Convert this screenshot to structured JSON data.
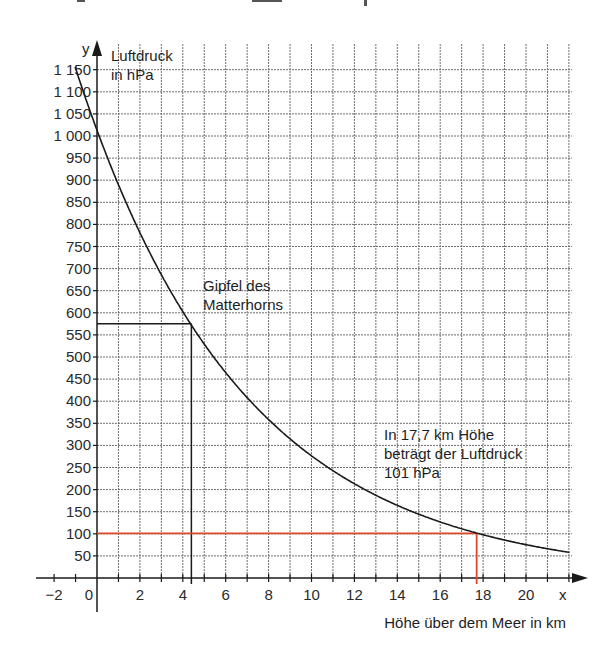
{
  "chart_data": {
    "type": "line",
    "title": "",
    "xlabel": "Höhe über dem Meer in km",
    "ylabel": "Luftdruck in hPa",
    "x_axis_symbol": "x",
    "y_axis_symbol": "y",
    "xlim": [
      -2.8,
      22
    ],
    "ylim": [
      0,
      1200
    ],
    "x_ticks": [
      -2,
      0,
      2,
      4,
      6,
      8,
      10,
      12,
      14,
      16,
      18,
      20
    ],
    "x_tick_labels": [
      "−2",
      "0",
      "2",
      "4",
      "6",
      "8",
      "10",
      "12",
      "14",
      "16",
      "18",
      "20"
    ],
    "y_ticks": [
      50,
      100,
      150,
      200,
      250,
      300,
      350,
      400,
      450,
      500,
      550,
      600,
      650,
      700,
      750,
      800,
      850,
      900,
      950,
      1000,
      1050,
      1100,
      1150
    ],
    "y_tick_labels": [
      "50",
      "100",
      "150",
      "200",
      "250",
      "300",
      "350",
      "400",
      "450",
      "500",
      "550",
      "600",
      "650",
      "700",
      "750",
      "800",
      "850",
      "900",
      "950",
      "1 000",
      "1 050",
      "1 100",
      "1 150"
    ],
    "grid": true,
    "series": [
      {
        "name": "Luftdruck",
        "color": "#1a1a1a",
        "x": [
          -1.0,
          0,
          1,
          2,
          3,
          4,
          4.4,
          5,
          6,
          7,
          8,
          9,
          10,
          11,
          12,
          13,
          14,
          15,
          16,
          17,
          17.7,
          18,
          19,
          20,
          21,
          22
        ],
        "y": [
          1150,
          1013,
          890,
          783,
          688,
          604,
          575,
          531,
          467,
          410,
          361,
          317,
          278,
          245,
          215,
          189,
          166,
          146,
          128,
          113,
          101,
          98,
          86,
          76,
          67,
          58
        ]
      }
    ],
    "markers": [
      {
        "name": "Matterhorn",
        "x": 4.4,
        "y": 575,
        "color": "#1a1a1a"
      },
      {
        "name": "17,7 km",
        "x": 17.7,
        "y": 101,
        "color": "#e0472a"
      }
    ],
    "annotations": [
      {
        "id": "matterhorn",
        "lines": [
          "Gipfel des",
          "Matterhorns"
        ]
      },
      {
        "id": "luftdruck_note",
        "lines": [
          "In 17,7 km Höhe",
          "beträgt der Luftdruck",
          "101 hPa"
        ]
      },
      {
        "id": "y_unit",
        "lines": [
          "Luftdruck",
          "in hPa"
        ]
      }
    ]
  },
  "colors": {
    "grid": "#6e6e6e",
    "axis": "#1a1a1a",
    "curve": "#1a1a1a",
    "highlight": "#e0472a"
  }
}
